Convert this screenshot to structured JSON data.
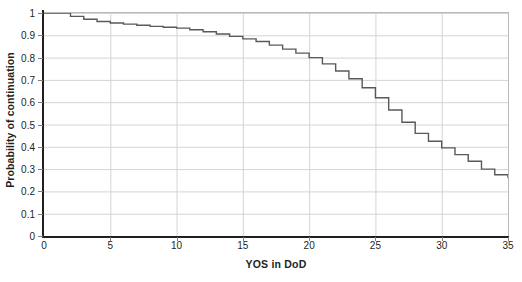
{
  "chart_data": {
    "type": "line",
    "subtype": "step",
    "title": "",
    "xlabel": "YOS in DoD",
    "ylabel": "Probability of continuation",
    "xlim": [
      0,
      35
    ],
    "ylim": [
      0,
      1
    ],
    "xticks": [
      "0",
      "5",
      "10",
      "15",
      "20",
      "25",
      "30",
      "35"
    ],
    "xtick_values": [
      0,
      5,
      10,
      15,
      20,
      25,
      30,
      35
    ],
    "yticks": [
      "0",
      "0.1",
      "0.2",
      "0.3",
      "0.4",
      "0.5",
      "0.6",
      "0.7",
      "0.8",
      "0.9",
      "1"
    ],
    "ytick_values": [
      0,
      0.1,
      0.2,
      0.3,
      0.4,
      0.5,
      0.6,
      0.7,
      0.8,
      0.9,
      1
    ],
    "grid": "both",
    "legend": "none",
    "series_color": "#595959",
    "x": [
      0,
      1,
      2,
      3,
      4,
      5,
      6,
      7,
      8,
      9,
      10,
      11,
      12,
      13,
      14,
      15,
      16,
      17,
      18,
      19,
      20,
      21,
      22,
      23,
      24,
      25,
      26,
      27,
      28,
      29,
      30,
      31,
      32,
      33,
      34,
      35
    ],
    "values": [
      1.0,
      1.0,
      0.985,
      0.972,
      0.962,
      0.955,
      0.95,
      0.945,
      0.94,
      0.936,
      0.932,
      0.925,
      0.916,
      0.906,
      0.895,
      0.884,
      0.872,
      0.856,
      0.838,
      0.82,
      0.8,
      0.772,
      0.74,
      0.705,
      0.665,
      0.62,
      0.565,
      0.51,
      0.46,
      0.425,
      0.395,
      0.365,
      0.335,
      0.3,
      0.275,
      0.26
    ],
    "series": [
      {
        "name": "Probability of continuation",
        "values": [
          1.0,
          1.0,
          0.985,
          0.972,
          0.962,
          0.955,
          0.95,
          0.945,
          0.94,
          0.936,
          0.932,
          0.925,
          0.916,
          0.906,
          0.895,
          0.884,
          0.872,
          0.856,
          0.838,
          0.82,
          0.8,
          0.772,
          0.74,
          0.705,
          0.665,
          0.62,
          0.565,
          0.51,
          0.46,
          0.425,
          0.395,
          0.365,
          0.335,
          0.3,
          0.275,
          0.26
        ]
      }
    ]
  }
}
